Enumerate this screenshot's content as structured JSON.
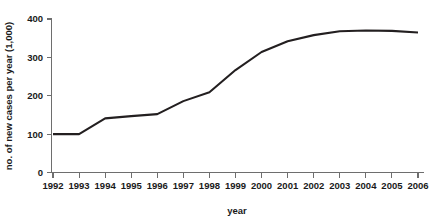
{
  "chart_data": {
    "type": "line",
    "title": "",
    "xlabel": "year",
    "ylabel": "no. of new cases per year (1,000)",
    "categories": [
      "1992",
      "1993",
      "1994",
      "1995",
      "1996",
      "1997",
      "1998",
      "1999",
      "2000",
      "2001",
      "2002",
      "2003",
      "2004",
      "2005",
      "2006"
    ],
    "x": [
      1992,
      1993,
      1994,
      1995,
      1996,
      1997,
      1998,
      1999,
      2000,
      2001,
      2002,
      2003,
      2004,
      2005,
      2006
    ],
    "values": [
      100,
      100,
      141,
      147,
      152,
      186,
      209,
      267,
      314,
      342,
      358,
      368,
      370,
      369,
      365
    ],
    "series": [
      {
        "name": "no. of new cases per year (1,000)",
        "values": [
          100,
          100,
          141,
          147,
          152,
          186,
          209,
          267,
          314,
          342,
          358,
          368,
          370,
          369,
          365
        ]
      }
    ],
    "ylim": [
      0,
      400
    ],
    "yticks": [
      0,
      100,
      200,
      300,
      400
    ],
    "ytick_labels": [
      "0",
      "100",
      "200",
      "300",
      "400"
    ],
    "xlim": [
      1992,
      2006
    ],
    "xticks": [
      1992,
      1993,
      1994,
      1995,
      1996,
      1997,
      1998,
      1999,
      2000,
      2001,
      2002,
      2003,
      2004,
      2005,
      2006
    ],
    "xtick_labels": [
      "1992",
      "1993",
      "1994",
      "1995",
      "1996",
      "1997",
      "1998",
      "1999",
      "2000",
      "2001",
      "2002",
      "2003",
      "2004",
      "2005",
      "2006"
    ],
    "grid": false,
    "legend": false,
    "legend_position": "none",
    "line_color": "#231f20",
    "axis_color": "#6e6e6e",
    "background_color": "#ffffff"
  }
}
